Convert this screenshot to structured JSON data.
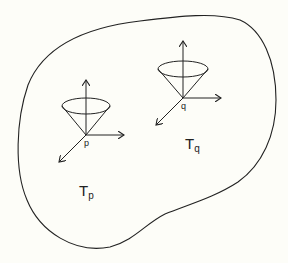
{
  "diagram": {
    "region": {
      "name": "manifold-region"
    },
    "points": [
      {
        "id": "p",
        "label": "p",
        "tangent_space_label_main": "T",
        "tangent_space_label_sub": "p"
      },
      {
        "id": "q",
        "label": "q",
        "tangent_space_label_main": "T",
        "tangent_space_label_sub": "q"
      }
    ],
    "colors": {
      "stroke": "#222222",
      "background": "#fdfdf8"
    }
  }
}
